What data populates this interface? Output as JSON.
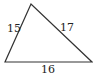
{
  "diagram": {
    "shape": "triangle",
    "sides": {
      "left": "15",
      "right": "17",
      "bottom": "16"
    },
    "stroke_color": "#333333",
    "background": "#ffffff"
  }
}
